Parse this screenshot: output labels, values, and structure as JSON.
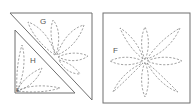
{
  "diagram": {
    "left_block": {
      "pieces": [
        {
          "label": "G",
          "shape": "triangle"
        },
        {
          "label": "H",
          "shape": "triangle"
        }
      ],
      "corner_mark": "E"
    },
    "right_block": {
      "label": "F",
      "shape": "square",
      "motif": "8-petal flower"
    },
    "colors": {
      "outline": "#6f6f6f",
      "stitch": "#7a7a7a",
      "label": "#555555"
    }
  }
}
